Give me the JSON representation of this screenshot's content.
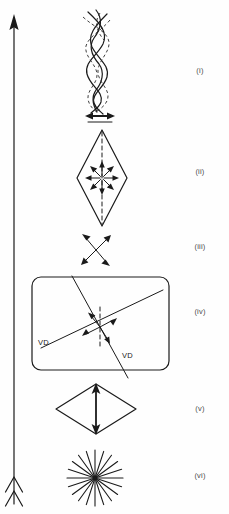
{
  "figure": {
    "background_color": "#fefefe",
    "ink_color": "#1a1a1a",
    "label_color": "#4a4a4a",
    "width": 229,
    "height": 514
  },
  "axis": {
    "name": "progression-arrow",
    "orientation": "vertical",
    "direction": "upward",
    "x": 14,
    "head_y": 18,
    "tail_y": 505,
    "head_style": "solid-filled-triangle",
    "tail_style": "double-chevron-fletching"
  },
  "stages": [
    {
      "id": "i",
      "label": "(i)",
      "label_x": 200,
      "label_y": 73,
      "shape": "twisted-braided-helix",
      "description": "Interwoven solid and dashed helical strands",
      "center_x": 100,
      "top_y": 10,
      "bottom_y": 108,
      "annotation": "horizontal-double-arrow",
      "annotation_y": 118,
      "annotation_half_width": 13
    },
    {
      "id": "ii",
      "label": "(ii)",
      "label_x": 200,
      "label_y": 174,
      "shape": "tall-rhombus",
      "description": "Tall diamond with dashed vertical axis and radial outward arrows",
      "center_x": 102,
      "center_y": 178,
      "half_width": 25,
      "half_height": 48,
      "radial_arrow_count": 8,
      "radial_arrow_length": 15,
      "has_dashed_axis": true
    },
    {
      "id": "iii",
      "label": "(iii)",
      "label_x": 200,
      "label_y": 249,
      "shape": "crossed-double-arrows",
      "description": "Two crossed double-headed arrows",
      "center_x": 96,
      "center_y": 250,
      "arm_length": 16
    },
    {
      "id": "iv",
      "label": "(iv)",
      "label_x": 200,
      "label_y": 314,
      "shape": "rounded-rectangle",
      "description": "Rounded rectangle containing two diagonal VD lines, a dashed vertical axis and four arrows",
      "x": 32,
      "y": 277,
      "width": 137,
      "height": 93,
      "corner_radius": 9,
      "vd_labels": [
        {
          "text": "VD",
          "x": 38,
          "y": 345
        },
        {
          "text": "VD",
          "x": 122,
          "y": 358
        }
      ],
      "has_dashed_axis": true,
      "diagonal_line_count": 2,
      "arrow_count": 4
    },
    {
      "id": "v",
      "label": "(v)",
      "label_x": 200,
      "label_y": 411,
      "shape": "flat-rhombus",
      "description": "Wide flat diamond with thick vertical double-headed arrow",
      "center_x": 96,
      "center_y": 409,
      "half_width": 40,
      "half_height": 25,
      "annotation": "vertical-double-arrow"
    },
    {
      "id": "vi",
      "label": "(vi)",
      "label_x": 200,
      "label_y": 478,
      "shape": "radial-starburst",
      "description": "Radial starburst of straight rays from a common centre",
      "center_x": 95,
      "center_y": 478,
      "ray_count": 20,
      "ray_length": 28
    }
  ]
}
